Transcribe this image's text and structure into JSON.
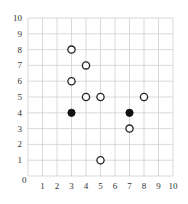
{
  "chart_data": {
    "type": "scatter",
    "title": "",
    "xlabel": "",
    "ylabel": "",
    "xlim": [
      0,
      10
    ],
    "ylim": [
      0,
      10
    ],
    "grid": true,
    "x_ticks": [
      "1",
      "2",
      "3",
      "4",
      "5",
      "6",
      "7",
      "8",
      "9",
      "10"
    ],
    "y_ticks": [
      "1",
      "2",
      "3",
      "4",
      "5",
      "6",
      "7",
      "8",
      "9",
      "10"
    ],
    "origin_label": "0",
    "series": [
      {
        "name": "open",
        "marker": "open-circle",
        "color": "#ffffff",
        "points": [
          [
            3,
            8
          ],
          [
            4,
            7
          ],
          [
            3,
            6
          ],
          [
            4,
            5
          ],
          [
            5,
            5
          ],
          [
            8,
            5
          ],
          [
            7,
            3
          ],
          [
            5,
            1
          ]
        ]
      },
      {
        "name": "filled",
        "marker": "filled-circle",
        "color": "#111111",
        "points": [
          [
            3,
            4
          ],
          [
            7,
            4
          ]
        ]
      }
    ]
  }
}
